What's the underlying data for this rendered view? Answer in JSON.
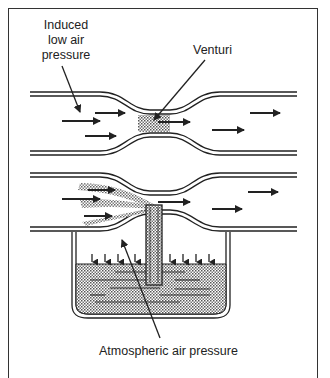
{
  "figure": {
    "labels": {
      "induced_low_air_pressure": "Induced\nlow air\npressure",
      "venturi": "Venturi",
      "atmospheric_air_pressure": "Atmospheric air pressure"
    },
    "components": [
      "upper venturi tube with shaded throat",
      "lower venturi tube with fuel discharge nozzle",
      "fuel bowl with liquid fuel",
      "airflow arrows (right to left)",
      "atmospheric pressure arrows on fuel surface"
    ],
    "colors": {
      "line": "#222222",
      "shading": "#9a9a9a",
      "background": "#ffffff"
    }
  }
}
